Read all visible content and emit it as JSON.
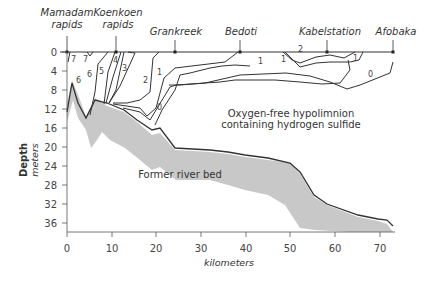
{
  "sites": [
    {
      "line1": "Mamadam",
      "line2": "rapids",
      "km": 0
    },
    {
      "line1": "Koenkoen",
      "line2": "rapids",
      "km": 11
    },
    {
      "line1": "Grankreek",
      "line2": "",
      "km": 24.5
    },
    {
      "line1": "Bedoti",
      "line2": "",
      "km": 38.5
    },
    {
      "line1": "Kabelstation",
      "line2": "",
      "km": 58
    },
    {
      "line1": "Afobaka",
      "line2": "",
      "km": 73
    }
  ],
  "y_axis": {
    "title": "Depth",
    "unit": "meters",
    "ticks": [
      "0",
      "4",
      "8",
      "12",
      "16",
      "20",
      "24",
      "28",
      "32",
      "36"
    ]
  },
  "x_axis": {
    "title": "kilometers",
    "ticks": [
      "0",
      "10",
      "20",
      "30",
      "40",
      "50",
      "60",
      "70"
    ]
  },
  "region_labels": {
    "hypolimnion_line1": "Oxygen-free hypolimnion",
    "hypolimnion_line2": "containing hydrogen sulfide",
    "river_bed": "Former river bed"
  },
  "contour_labels": [
    "7",
    "7",
    "6",
    "6",
    "5",
    "4",
    "3",
    "2",
    "1",
    "0",
    "1",
    "1",
    "2",
    "1",
    "0"
  ],
  "colors": {
    "line": "#333333",
    "bed_shadow": "#c8c8c8",
    "text": "#333333"
  }
}
